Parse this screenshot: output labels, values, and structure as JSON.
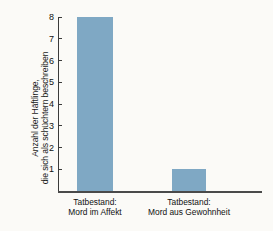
{
  "chart_data": {
    "type": "bar",
    "title": "",
    "xlabel": "",
    "ylabel_lines": [
      "Anzahl der Häftlinge,",
      "die sich als schüchtern beschreiben"
    ],
    "ylabel": "Anzahl der Häftlinge, die sich als schüchtern beschreiben",
    "categories": [
      "Tatbestand: Mord im Affekt",
      "Tatbestand: Mord aus Gewohnheit"
    ],
    "category_lines": [
      [
        "Tatbestand:",
        "Mord im Affekt"
      ],
      [
        "Tatbestand:",
        "Mord aus Gewohnheit"
      ]
    ],
    "values": [
      8,
      1
    ],
    "yticks": [
      1,
      2,
      3,
      4,
      5,
      6,
      7,
      8
    ],
    "ylim": [
      0,
      8
    ],
    "grid": false,
    "legend": false,
    "bar_color": "#7fa8c4",
    "axis_color": "#3b3b3b",
    "background_color": "#fbfaf7"
  }
}
